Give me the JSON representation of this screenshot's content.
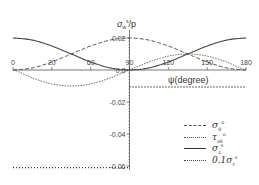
{
  "chart_data": {
    "type": "line",
    "title": "",
    "xlabel": "ψ(degree)",
    "ylabel": "σ_w^s/p",
    "xlim": [
      0,
      180
    ],
    "ylim": [
      -0.06,
      0.02
    ],
    "x_ticks": [
      "0",
      "20",
      "60",
      "90",
      "120",
      "150",
      "180"
    ],
    "y_ticks": [
      "0.02",
      "0.0",
      "-0.02",
      "-0.04",
      "-0.06"
    ],
    "grid": false,
    "legend_position": "lower right",
    "x": [
      0,
      15,
      30,
      45,
      60,
      75,
      90,
      105,
      120,
      135,
      150,
      165,
      180
    ],
    "series": [
      {
        "name": "σ_θ^o",
        "style": "dashed",
        "values": [
          0.0,
          0.0013,
          0.005,
          0.01,
          0.015,
          0.0187,
          0.02,
          0.0187,
          0.015,
          0.01,
          0.005,
          0.0013,
          0.0
        ]
      },
      {
        "name": "τ_zθ^o",
        "style": "fine-dotted",
        "values": [
          0.0,
          -0.005,
          -0.0087,
          -0.01,
          -0.0087,
          -0.005,
          0.0,
          0.005,
          0.0087,
          0.01,
          0.0087,
          0.005,
          0.0
        ]
      },
      {
        "name": "σ_z^s",
        "style": "solid",
        "values": [
          0.02,
          0.0187,
          0.015,
          0.01,
          0.005,
          0.0013,
          0.0,
          0.0013,
          0.005,
          0.01,
          0.015,
          0.0187,
          0.02
        ]
      },
      {
        "name": "0.1σ_r^s",
        "style": "dotted",
        "values": [
          -0.061,
          -0.061,
          -0.061,
          -0.061,
          -0.061,
          -0.061,
          -0.061,
          -0.0106,
          -0.0106,
          -0.0106,
          -0.0106,
          -0.0106,
          -0.0106
        ]
      }
    ]
  },
  "labels": {
    "ylabel_main": "σ",
    "ylabel_sub": "w",
    "ylabel_sup": "s",
    "ylabel_tail": "/p",
    "xlabel": "ψ(degree)"
  },
  "legend": [
    {
      "base": "σ",
      "sub": "θ",
      "sup": "o"
    },
    {
      "base": "τ",
      "sub": "zθ",
      "sup": "o"
    },
    {
      "base": "σ",
      "sub": "z",
      "sup": "s"
    },
    {
      "base": "0.1σ",
      "sub": "r",
      "sup": "s"
    }
  ]
}
